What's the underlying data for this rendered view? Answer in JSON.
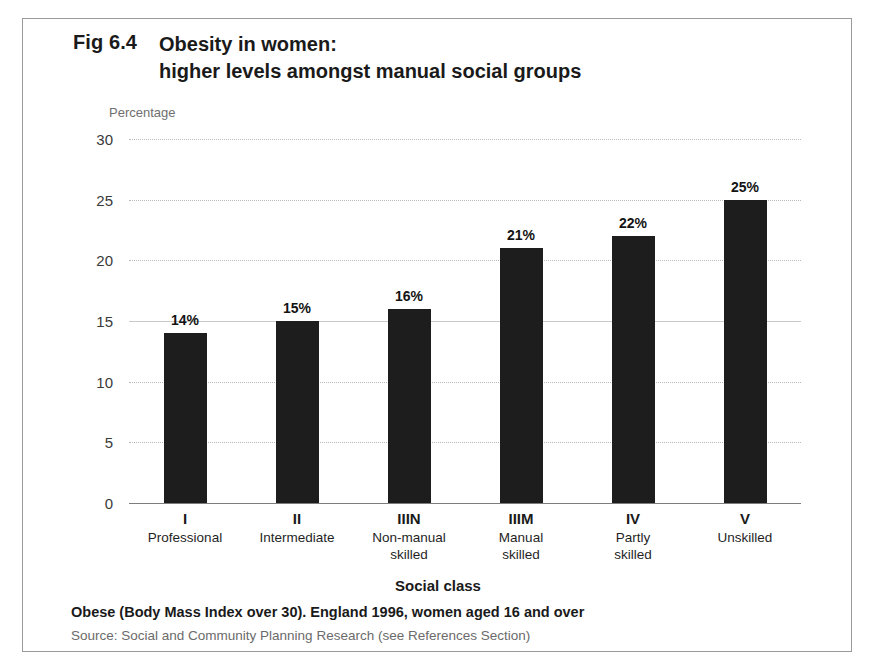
{
  "figure": {
    "number": "Fig 6.4",
    "title_line_1": "Obesity in women:",
    "title_line_2": "higher levels amongst manual social groups",
    "y_axis_caption": "Percentage",
    "x_axis_title": "Social class",
    "footnote": "Obese (Body Mass Index over 30).  England 1996, women aged 16 and over",
    "source": "Source: Social and Community Planning Research (see References Section)"
  },
  "chart_data": {
    "type": "bar",
    "title": "Fig 6.4 Obesity in women: higher levels amongst manual social groups",
    "xlabel": "Social class",
    "ylabel": "Percentage",
    "ylim": [
      0,
      30
    ],
    "yticks": [
      0,
      5,
      10,
      15,
      20,
      25,
      30
    ],
    "ytick_labels": [
      "0",
      "5",
      "10",
      "15",
      "20",
      "25",
      "30"
    ],
    "grid": true,
    "legend": false,
    "categories": [
      "I",
      "II",
      "IIIN",
      "IIIM",
      "IV",
      "V"
    ],
    "category_names": [
      "Professional",
      "Intermediate",
      "Non-manual skilled",
      "Manual skilled",
      "Partly skilled",
      "Unskilled"
    ],
    "category_name_lines": [
      [
        "Professional"
      ],
      [
        "Intermediate"
      ],
      [
        "Non-manual",
        "skilled"
      ],
      [
        "Manual",
        "skilled"
      ],
      [
        "Partly",
        "skilled"
      ],
      [
        "Unskilled"
      ]
    ],
    "values": [
      14,
      15,
      16,
      21,
      22,
      25
    ],
    "data_labels": [
      "14%",
      "15%",
      "16%",
      "21%",
      "22%",
      "25%"
    ],
    "bar_color": "#1d1d1d",
    "annotation": "Obese (Body Mass Index over 30).  England 1996, women aged 16 and over"
  }
}
